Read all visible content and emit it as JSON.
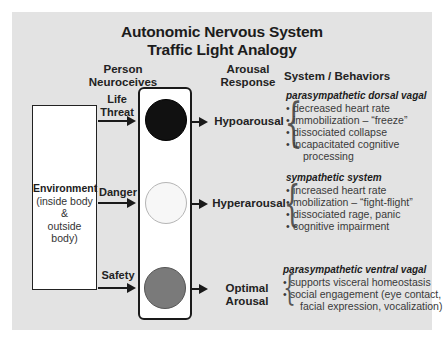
{
  "title": {
    "line1": "Autonomic Nervous System",
    "line2": "Traffic Light Analogy"
  },
  "headers": {
    "person_neuroceives": [
      "Person",
      "Neuroceives"
    ],
    "arousal_response": [
      "Arousal",
      "Response"
    ],
    "system_behaviors": "System / Behaviors"
  },
  "environment": {
    "label": "Environment",
    "line2": "(inside body",
    "line3": "&",
    "line4": "outside body)"
  },
  "colors": {
    "panel_bg": "#e3e3e3",
    "lamp_top": "#111111",
    "lamp_middle": "#f7f7f7",
    "lamp_bottom": "#7a7a7a"
  },
  "rows": [
    {
      "neuroception": [
        "Life",
        "Threat"
      ],
      "lamp": "dark",
      "response": [
        "Hypoarousal"
      ],
      "system": "parasympathetic dorsal vagal",
      "behaviors": [
        {
          "text": "decreased heart rate"
        },
        {
          "text": "immobilization – “freeze”"
        },
        {
          "text": "dissociated collapse"
        },
        {
          "text": "incapacitated cognitive",
          "cont": "processing"
        }
      ]
    },
    {
      "neuroception": [
        "Danger"
      ],
      "lamp": "light",
      "response": [
        "Hyperarousal"
      ],
      "system": "sympathetic system",
      "behaviors": [
        {
          "text": "increased heart rate"
        },
        {
          "text": "mobilization – “fight-flight”"
        },
        {
          "text": "dissociated rage, panic"
        },
        {
          "text": "cognitive impairment"
        }
      ]
    },
    {
      "neuroception": [
        "Safety"
      ],
      "lamp": "gray",
      "response": [
        "Optimal",
        "Arousal"
      ],
      "system": "parasympathetic ventral vagal",
      "behaviors": [
        {
          "text": "supports visceral homeostasis"
        },
        {
          "text": "social engagement (eye contact,",
          "cont": "facial expression, vocalization)"
        }
      ]
    }
  ]
}
